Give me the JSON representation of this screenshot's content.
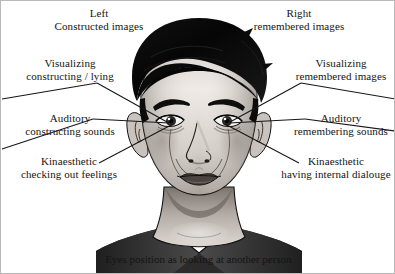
{
  "diagram": {
    "caption": "Eyes position as looking at another person",
    "headers": {
      "left": {
        "line1": "Left",
        "line2": "Constructed images"
      },
      "right": {
        "line1": "Right",
        "line2": "remembered images"
      }
    },
    "cues_left": [
      {
        "id": "visual-constructing",
        "line1": "Visualizing",
        "line2": "constructing / lying"
      },
      {
        "id": "auditory-constructing",
        "line1": "Auditory",
        "line2": "constructing sounds"
      },
      {
        "id": "kinaesthetic-feelings",
        "line1": "Kinaesthetic",
        "line2": "checking out feelings"
      }
    ],
    "cues_right": [
      {
        "id": "visual-remembering",
        "line1": "Visualizing",
        "line2": "remembered images"
      },
      {
        "id": "auditory-remembering",
        "line1": "Auditory",
        "line2": "remembering sounds"
      },
      {
        "id": "kinaesthetic-dialogue",
        "line1": "Kinaesthetic",
        "line2": "having internal dialouge"
      }
    ],
    "colors": {
      "background": "#ffffff",
      "text": "#141414",
      "leader_line": "#1a1a1a",
      "hair": "#0b0b0b",
      "skin_light": "#f2efec",
      "skin_mid": "#b9b2ac",
      "skin_shadow": "#7d7670",
      "shirt": "#2e2e2e",
      "outline": "#111111",
      "border": "#b9b9b9"
    }
  }
}
